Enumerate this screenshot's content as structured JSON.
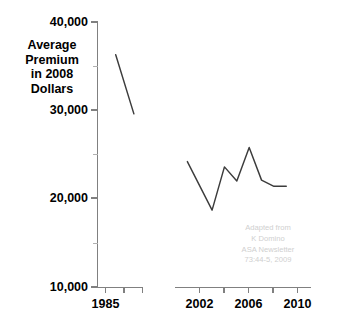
{
  "chart_data": {
    "type": "line",
    "title": "",
    "xlabel": "",
    "ylabel": "Average\nPremium\nin 2008\nDollars",
    "ylim": [
      10000,
      40000
    ],
    "grid": false,
    "legend": "none",
    "axis_break": true,
    "y_ticks_major": [
      "40,000",
      "30,000",
      "20,000",
      "10,000"
    ],
    "y_tick_values_major": [
      40000,
      30000,
      20000,
      10000
    ],
    "y_tick_values_minor": [
      35000,
      25000,
      15000
    ],
    "x_ticks_labeled": [
      "1985",
      "2002",
      "2006",
      "2010"
    ],
    "x_tick_values_labeled": [
      1985,
      2002,
      2006,
      2010
    ],
    "x_segments": [
      {
        "name": "early",
        "xmin": 1983,
        "xmax": 1988
      },
      {
        "name": "late",
        "xmin": 2000,
        "xmax": 2011
      }
    ],
    "series": [
      {
        "name": "early-period",
        "x": [
          1985,
          1987
        ],
        "values": [
          36300,
          29600
        ]
      },
      {
        "name": "late-period",
        "x": [
          2001,
          2003,
          2004,
          2005,
          2006,
          2007,
          2008,
          2009
        ],
        "values": [
          24200,
          18700,
          23600,
          22000,
          25800,
          22100,
          21400,
          21400
        ]
      }
    ]
  },
  "credit": {
    "text": "Adapted from\nK Domino\nASA Newsletter\n73:44-5, 2009",
    "color": "#cfcfcf"
  },
  "colors": {
    "line": "#3c3c3c",
    "axis": "#808080",
    "text": "#000000",
    "background": "#ffffff"
  }
}
